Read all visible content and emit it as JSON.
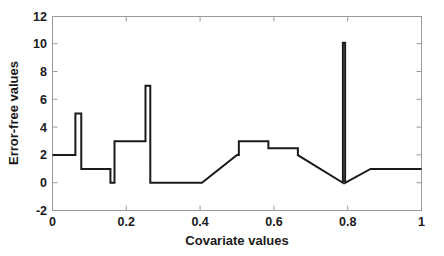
{
  "chart_data": {
    "type": "line",
    "title": "",
    "xlabel": "Covariate values",
    "ylabel": "Error-free values",
    "xlim": [
      0,
      1
    ],
    "ylim": [
      -2,
      12
    ],
    "xticks": [
      0,
      0.2,
      0.4,
      0.6,
      0.8,
      1
    ],
    "xticklabels": [
      "0",
      "0.2",
      "0.4",
      "0.6",
      "0.8",
      "1"
    ],
    "yticks": [
      -2,
      0,
      2,
      4,
      6,
      8,
      10,
      12
    ],
    "yticklabels": [
      "-2",
      "0",
      "2",
      "4",
      "6",
      "8",
      "10",
      "12"
    ],
    "grid": false,
    "legend": null,
    "line_color": "#1a1a1a",
    "line_width": 2,
    "series": [
      {
        "name": "error-free step function",
        "points": [
          [
            0.0,
            2.0
          ],
          [
            0.062,
            2.0
          ],
          [
            0.062,
            5.0
          ],
          [
            0.078,
            5.0
          ],
          [
            0.078,
            1.0
          ],
          [
            0.157,
            1.0
          ],
          [
            0.157,
            0.0
          ],
          [
            0.168,
            0.0
          ],
          [
            0.168,
            3.0
          ],
          [
            0.252,
            3.0
          ],
          [
            0.252,
            7.0
          ],
          [
            0.265,
            7.0
          ],
          [
            0.265,
            0.0
          ],
          [
            0.405,
            0.0
          ],
          [
            0.5,
            2.0
          ],
          [
            0.505,
            2.0
          ],
          [
            0.505,
            3.0
          ],
          [
            0.585,
            3.0
          ],
          [
            0.585,
            2.5
          ],
          [
            0.665,
            2.5
          ],
          [
            0.665,
            2.0
          ],
          [
            0.787,
            0.0
          ],
          [
            0.787,
            10.1
          ],
          [
            0.793,
            10.1
          ],
          [
            0.793,
            0.0
          ],
          [
            0.862,
            1.0
          ],
          [
            1.0,
            1.0
          ]
        ]
      }
    ]
  }
}
